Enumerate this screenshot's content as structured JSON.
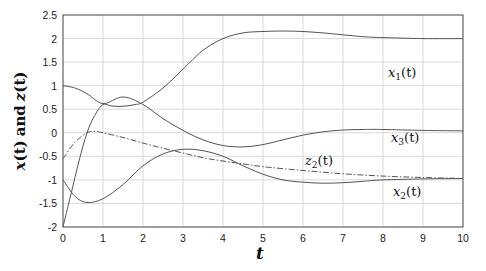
{
  "chart_data": {
    "type": "line",
    "title": "",
    "xlabel": "t",
    "ylabel": "x(t) and z(t)",
    "xlim": [
      0,
      10
    ],
    "ylim": [
      -2,
      2.5
    ],
    "xticks": [
      "0",
      "1",
      "2",
      "3",
      "4",
      "5",
      "6",
      "7",
      "8",
      "9",
      "10"
    ],
    "yticks": [
      "2.5",
      "2",
      "1.5",
      "1",
      "0.5",
      "0",
      "-0.5",
      "-1",
      "-1.5",
      "-2"
    ],
    "grid": true,
    "legend": "none (inline curve labels)",
    "series": [
      {
        "name": "x1(t)",
        "style": "solid",
        "x": [
          0,
          0.2,
          0.4,
          0.6,
          0.8,
          1.0,
          1.2,
          1.4,
          1.6,
          1.8,
          2.0,
          2.5,
          3.0,
          3.5,
          4.0,
          4.5,
          5.0,
          5.5,
          6.0,
          6.5,
          7.0,
          7.5,
          8.0,
          9.0,
          10.0
        ],
        "values": [
          -2.0,
          -1.3,
          -0.6,
          0.0,
          0.38,
          0.6,
          0.57,
          0.56,
          0.57,
          0.6,
          0.65,
          0.95,
          1.35,
          1.75,
          2.0,
          2.12,
          2.15,
          2.16,
          2.15,
          2.12,
          2.08,
          2.04,
          2.02,
          2.0,
          2.0
        ]
      },
      {
        "name": "x2(t)",
        "style": "solid",
        "x": [
          0,
          0.3,
          0.6,
          1.0,
          1.5,
          2.0,
          2.5,
          3.0,
          3.5,
          4.0,
          4.5,
          5.0,
          5.5,
          6.0,
          6.5,
          7.0,
          7.5,
          8.0,
          9.0,
          10.0
        ],
        "values": [
          -1.0,
          -1.35,
          -1.48,
          -1.4,
          -1.1,
          -0.7,
          -0.45,
          -0.35,
          -0.38,
          -0.5,
          -0.7,
          -0.88,
          -1.0,
          -1.05,
          -1.07,
          -1.06,
          -1.03,
          -1.0,
          -0.98,
          -0.97
        ]
      },
      {
        "name": "x3(t)",
        "style": "solid",
        "x": [
          0,
          0.3,
          0.6,
          1.0,
          1.5,
          2.0,
          2.5,
          3.0,
          3.5,
          4.0,
          4.5,
          5.0,
          5.5,
          6.0,
          6.5,
          7.0,
          7.5,
          8.0,
          9.0,
          10.0
        ],
        "values": [
          1.0,
          0.95,
          0.83,
          0.62,
          0.76,
          0.6,
          0.3,
          0.05,
          -0.15,
          -0.27,
          -0.3,
          -0.25,
          -0.15,
          -0.05,
          0.02,
          0.06,
          0.07,
          0.07,
          0.05,
          0.04
        ]
      },
      {
        "name": "z2(t)",
        "style": "dash-dot",
        "x": [
          0,
          0.3,
          0.6,
          0.8,
          1.0,
          1.5,
          2.0,
          2.5,
          3.0,
          3.5,
          4.0,
          4.5,
          5.0,
          6.0,
          7.0,
          8.0,
          9.0,
          10.0
        ],
        "values": [
          -0.55,
          -0.2,
          0.0,
          0.03,
          0.0,
          -0.1,
          -0.22,
          -0.33,
          -0.43,
          -0.53,
          -0.6,
          -0.66,
          -0.72,
          -0.8,
          -0.87,
          -0.92,
          -0.95,
          -0.97
        ]
      }
    ],
    "annotations": [
      {
        "text": "x1(t)",
        "x": 8.7,
        "y": 2.0
      },
      {
        "text": "x3(t)",
        "x": 8.7,
        "y": 0.25
      },
      {
        "text": "z2(t)",
        "x": 6.2,
        "y": -0.55
      },
      {
        "text": "x2(t)",
        "x": 8.7,
        "y": -1.15
      }
    ]
  },
  "labels": {
    "xlabel": "t",
    "ylabel_x": "x",
    "ylabel_and": "and",
    "ylabel_z": "z",
    "curve_x1": "x",
    "curve_x1_sub": "1",
    "curve_x2": "x",
    "curve_x2_sub": "2",
    "curve_x3": "x",
    "curve_x3_sub": "3",
    "curve_z2": "z",
    "curve_z2_sub": "2",
    "paren_t": "(t)"
  },
  "colors": {
    "line": "#555555",
    "grid": "#d0d0d0",
    "axis": "#333333"
  }
}
